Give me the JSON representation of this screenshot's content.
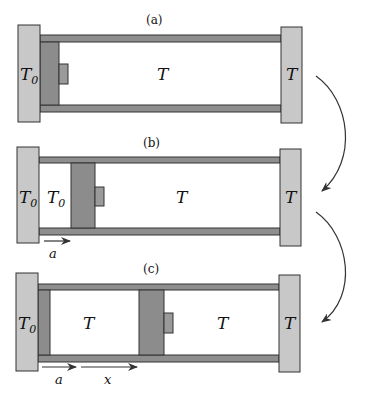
{
  "panels": [
    {
      "id": "a",
      "caption": "(a)",
      "left_reservoir_label": "T",
      "left_reservoir_sub": "0",
      "chamber_label": "T",
      "right_reservoir_label": "T"
    },
    {
      "id": "b",
      "caption": "(b)",
      "left_reservoir_label": "T",
      "left_reservoir_sub": "0",
      "gas_left_label": "T",
      "gas_left_sub": "0",
      "chamber_label": "T",
      "right_reservoir_label": "T",
      "arrow_a_label": "a"
    },
    {
      "id": "c",
      "caption": "(c)",
      "left_reservoir_label": "T",
      "left_reservoir_sub": "0",
      "middle_label": "T",
      "chamber_label": "T",
      "right_reservoir_label": "T",
      "arrow_a_label": "a",
      "arrow_x_label": "x"
    }
  ],
  "colors": {
    "reservoir": "#c8c8c8",
    "piston": "#8c8c8c",
    "rail": "#8e8e8e",
    "outline": "#333333",
    "arrow": "#333333"
  }
}
